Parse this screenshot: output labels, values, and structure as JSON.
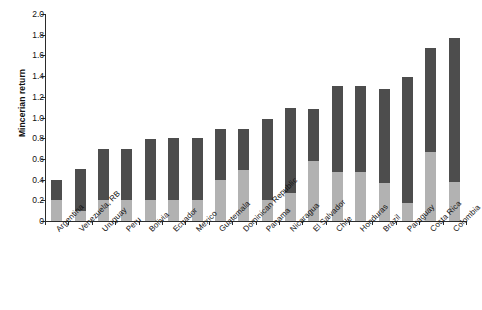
{
  "chart_data": {
    "type": "bar",
    "title": "",
    "subtitle": "",
    "xlabel": "",
    "ylabel": "Mincerian return",
    "stacked": true,
    "grid": false,
    "legend_position": "none",
    "ylim": [
      0,
      2.0
    ],
    "ytick_values": [
      0,
      0.2,
      0.4,
      0.6,
      0.8,
      1.0,
      1.2,
      1.4,
      1.6,
      1.8,
      2.0
    ],
    "ytick_labels": [
      "0",
      "0.2",
      "0.4",
      "0.6",
      "0.8",
      "1.0",
      "1.2",
      "1.4",
      "1.6",
      "1.8",
      "2.0"
    ],
    "categories": [
      "Argentina",
      "Venezuela, RB",
      "Uruguay",
      "Peru",
      "Bolivia",
      "Ecuador",
      "Mexico",
      "Guatemala",
      "Dominican Republic",
      "Panama",
      "Nicaragua",
      "El Salvador",
      "Chile",
      "Honduras",
      "Brazil",
      "Paraguay",
      "Costa Rica",
      "Colombia"
    ],
    "series": [
      {
        "name": "lower segment",
        "color": "#b2b2b2",
        "values": [
          0.2,
          0.1,
          0.2,
          0.2,
          0.2,
          0.2,
          0.2,
          0.4,
          0.49,
          0.2,
          0.27,
          0.58,
          0.47,
          0.47,
          0.37,
          0.17,
          0.67,
          0.38
        ]
      },
      {
        "name": "upper segment",
        "color": "#4d4d4d",
        "values": [
          0.2,
          0.4,
          0.5,
          0.5,
          0.59,
          0.6,
          0.6,
          0.49,
          0.4,
          0.79,
          0.82,
          0.5,
          0.83,
          0.83,
          0.91,
          1.22,
          1.0,
          1.39
        ]
      }
    ],
    "totals": [
      0.4,
      0.5,
      0.7,
      0.7,
      0.79,
      0.8,
      0.8,
      0.89,
      0.89,
      0.99,
      1.09,
      1.08,
      1.3,
      1.3,
      1.28,
      1.39,
      1.67,
      1.77
    ]
  }
}
